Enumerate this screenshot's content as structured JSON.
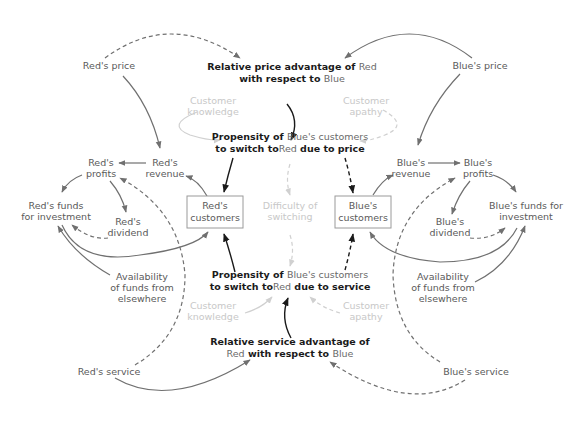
{
  "diagram": {
    "type": "causal-loop-diagram",
    "colors": {
      "text_primary": "#1a1a1a",
      "text_secondary": "#5a5a5a",
      "text_faint": "#c8c8c8",
      "line": "#707070",
      "box_border": "#9a9a9a"
    },
    "nodes": {
      "reds_price": "Red's price",
      "blues_price": "Blue's price",
      "rel_price_adv": {
        "line1_a": "Relative price advantage of ",
        "line1_b": "Red",
        "line2_a": "with respect to ",
        "line2_b": "Blue"
      },
      "cust_knowledge_top": {
        "line1": "Customer",
        "line2": "knowledge"
      },
      "cust_apathy_top": {
        "line1": "Customer",
        "line2": "apathy"
      },
      "prop_price": {
        "line1_a": "Propensity of ",
        "line1_b": "Blue's customers",
        "line2_a": "to switch to",
        "line2_b": "Red",
        "line2_c": " due to price"
      },
      "reds_profits": {
        "line1": "Red's",
        "line2": "profits"
      },
      "reds_revenue": {
        "line1": "Red's",
        "line2": "revenue"
      },
      "reds_funds": {
        "line1": "Red's funds",
        "line2": "for investment"
      },
      "reds_dividend": {
        "line1": "Red's",
        "line2": "dividend"
      },
      "reds_customers": {
        "line1": "Red's",
        "line2": "customers"
      },
      "difficulty": {
        "line1": "Difficulty of",
        "line2": "switching"
      },
      "blues_customers": {
        "line1": "Blue's",
        "line2": "customers"
      },
      "blues_revenue": {
        "line1": "Blue's",
        "line2": "revenue"
      },
      "blues_profits": {
        "line1": "Blue's",
        "line2": "profits"
      },
      "blues_funds": {
        "line1": "Blue's funds for",
        "line2": "investment"
      },
      "blues_dividend": {
        "line1": "Blue's",
        "line2": "dividend"
      },
      "avail_left": {
        "line1": "Availability",
        "line2": "of funds from",
        "line3": "elsewhere"
      },
      "avail_right": {
        "line1": "Availability",
        "line2": "of funds from",
        "line3": "elsewhere"
      },
      "prop_service": {
        "line1_a": "Propensity of ",
        "line1_b": "Blue's customers",
        "line2_a": "to switch to",
        "line2_b": "Red",
        "line2_c": " due to service"
      },
      "cust_knowledge_bottom": {
        "line1": "Customer",
        "line2": "knowledge"
      },
      "cust_apathy_bottom": {
        "line1": "Customer",
        "line2": "apathy"
      },
      "rel_service_adv": {
        "line1": "Relative service advantage of",
        "line2_a": "Red",
        "line2_b": " with respect to ",
        "line2_c": "Blue"
      },
      "reds_service": "Red's service",
      "blues_service": "Blue's service"
    }
  }
}
